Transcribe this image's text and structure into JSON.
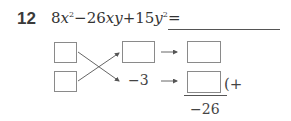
{
  "problem": {
    "number": "12",
    "expression_parts": {
      "a": "8",
      "x": "x",
      "exp1": "2",
      "minus": "−26",
      "xy": "xy",
      "plus": "+15",
      "y": "y",
      "exp2": "2",
      "eq": "="
    },
    "expression_full": "8x²−26xy+15y²=",
    "answer_blank": ""
  },
  "cross_method": {
    "left_boxes": [
      "",
      ""
    ],
    "middle_top_box": "",
    "middle_bottom_value": "−3",
    "right_boxes": [
      "",
      ""
    ],
    "sum_value": "−26",
    "sum_operator": "(+"
  },
  "colors": {
    "box_border": "#8a8a8a",
    "line": "#555555",
    "text": "#333333"
  }
}
